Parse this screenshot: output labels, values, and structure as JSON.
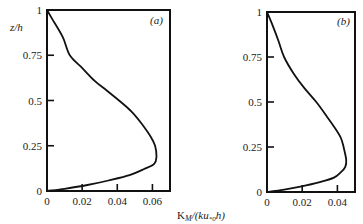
{
  "chart_data": [
    {
      "type": "line",
      "panel": "(a)",
      "title": "",
      "xlabel": "K_M/(ku_*0 h)",
      "ylabel": "z/h",
      "xlim": [
        0,
        0.07
      ],
      "ylim": [
        0,
        1
      ],
      "x_ticks": [
        0,
        0.02,
        0.04,
        0.06
      ],
      "x_tick_labels": [
        "0",
        "0.02",
        "0.04",
        "0.06"
      ],
      "y_ticks": [
        0,
        0.25,
        0.5,
        0.75,
        1
      ],
      "y_tick_labels": [
        "0",
        "0.25",
        "0.5",
        "0.75",
        "1"
      ],
      "grid": false,
      "legend": null,
      "series": [
        {
          "name": "K_M profile (a)",
          "x": [
            0,
            0.003,
            0.009,
            0.013,
            0.02,
            0.027,
            0.034,
            0.041,
            0.048,
            0.054,
            0.059,
            0.0615,
            0.0623,
            0.061,
            0.055,
            0.047,
            0.035,
            0.023,
            0.01,
            0
          ],
          "y": [
            1,
            0.95,
            0.85,
            0.75,
            0.68,
            0.61,
            0.555,
            0.5,
            0.44,
            0.37,
            0.3,
            0.25,
            0.19,
            0.15,
            0.12,
            0.088,
            0.058,
            0.033,
            0.012,
            0
          ]
        }
      ]
    },
    {
      "type": "line",
      "panel": "(b)",
      "title": "",
      "xlabel": "K_M/(ku_*0 h)",
      "ylabel": "",
      "xlim": [
        0,
        0.05
      ],
      "ylim": [
        0,
        1
      ],
      "x_ticks": [
        0,
        0.02,
        0.04
      ],
      "x_tick_labels": [
        "0",
        "0.02",
        "0.04"
      ],
      "y_ticks": [
        0,
        0.25,
        0.5,
        0.75,
        1
      ],
      "y_tick_labels": [
        "0",
        "0.25",
        "0.5",
        "0.75",
        "1"
      ],
      "grid": false,
      "legend": null,
      "series": [
        {
          "name": "K_M profile (b)",
          "x": [
            0,
            0.003,
            0.0065,
            0.0097,
            0.015,
            0.021,
            0.028,
            0.034,
            0.039,
            0.042,
            0.0435,
            0.045,
            0.0445,
            0.042,
            0.038,
            0.03,
            0.019,
            0.009,
            0
          ],
          "y": [
            1,
            0.93,
            0.84,
            0.75,
            0.66,
            0.58,
            0.5,
            0.42,
            0.35,
            0.3,
            0.25,
            0.18,
            0.14,
            0.11,
            0.08,
            0.055,
            0.03,
            0.012,
            0
          ]
        }
      ]
    }
  ],
  "labels": {
    "ylabel_a": "z/h",
    "panel_a": "(a)",
    "panel_b": "(b)",
    "xlabel_main": "K",
    "xlabel_sub_M": "M",
    "xlabel_mid": "/(ku",
    "xlabel_sub_star0": "*0",
    "xlabel_end": "h)"
  }
}
